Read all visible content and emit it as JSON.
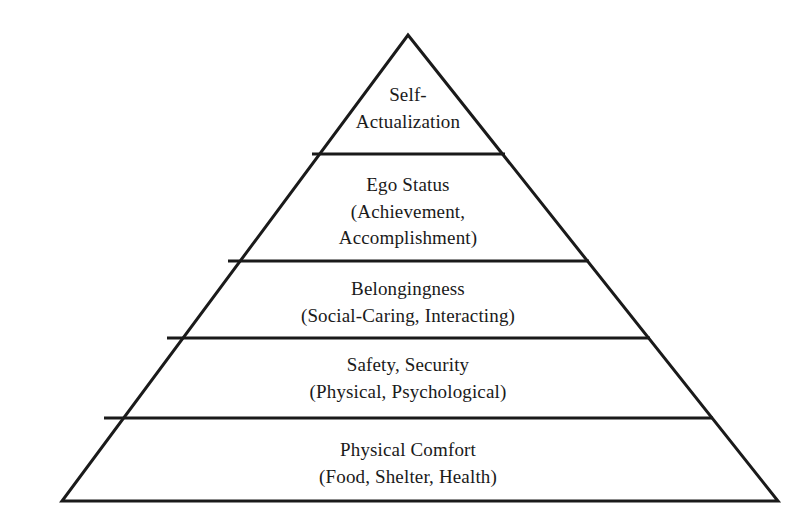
{
  "diagram": {
    "type": "pyramid",
    "name": "needs-hierarchy-pyramid",
    "background_color": "#ffffff",
    "stroke_color": "#1a1a1a",
    "text_color": "#1a1a1a",
    "stroke_width": 3,
    "geometry": {
      "apex": [
        408,
        35
      ],
      "base_left": [
        62,
        501
      ],
      "base_right": [
        778,
        501
      ],
      "divider_y": [
        154,
        261,
        338,
        418
      ]
    },
    "tiers": [
      {
        "id": "self-actualization",
        "level": 5,
        "position_from_top": 1,
        "line1": "Self-",
        "line2": "Actualization"
      },
      {
        "id": "ego-status",
        "level": 4,
        "position_from_top": 2,
        "line1": "Ego Status",
        "line2": "(Achievement,",
        "line3": "Accomplishment)"
      },
      {
        "id": "belongingness",
        "level": 3,
        "position_from_top": 3,
        "line1": "Belongingness",
        "line2": "(Social-Caring, Interacting)"
      },
      {
        "id": "safety-security",
        "level": 2,
        "position_from_top": 4,
        "line1": "Safety, Security",
        "line2": "(Physical, Psychological)"
      },
      {
        "id": "physical-comfort",
        "level": 1,
        "position_from_top": 5,
        "line1": "Physical Comfort",
        "line2": "(Food, Shelter, Health)"
      }
    ]
  }
}
